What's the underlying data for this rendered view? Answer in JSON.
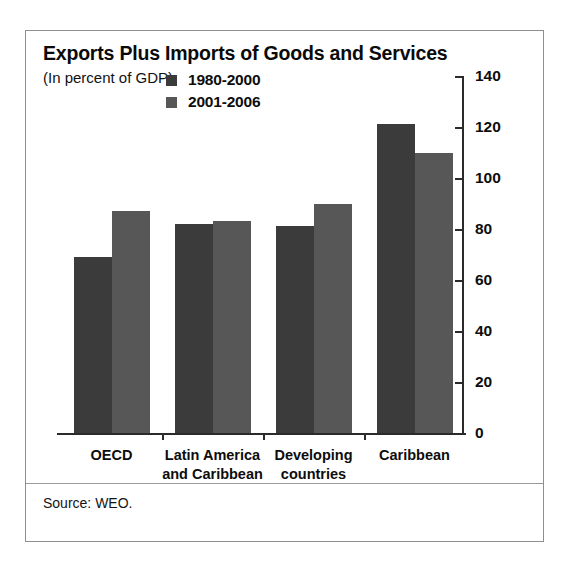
{
  "chart_data": {
    "type": "bar",
    "title": "Exports Plus Imports of Goods and Services",
    "subtitle": "(In percent of GDP)",
    "xlabel": "",
    "ylabel": "",
    "ylim": [
      0,
      140
    ],
    "yticks": [
      0,
      20,
      40,
      60,
      80,
      100,
      120,
      140
    ],
    "grid": false,
    "legend_position": "top-center",
    "axis_side": "right",
    "categories": [
      "OECD",
      "Latin America\nand Caribbean",
      "Developing\ncountries",
      "Caribbean"
    ],
    "series": [
      {
        "name": "1980-2000",
        "color": "#3b3b3b",
        "values": [
          69,
          82,
          81,
          121
        ]
      },
      {
        "name": "2001-2006",
        "color": "#575757",
        "values": [
          87,
          83,
          90,
          110
        ]
      }
    ],
    "source": "Source: WEO."
  },
  "figure": {
    "title": "Exports Plus Imports of Goods and Services",
    "subtitle": "(In percent of GDP)",
    "source": "Source: WEO."
  }
}
